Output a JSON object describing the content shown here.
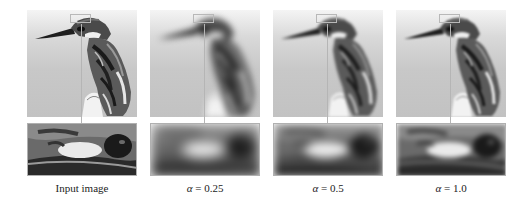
{
  "figure": {
    "layout": "4 columns, each with full image on top and zoomed eye-region inset below, connected by a leader line",
    "panels": [
      {
        "id": "input",
        "caption": "Input image",
        "sharpness": "sharp"
      },
      {
        "id": "alpha-0.25",
        "caption_symbol": "α",
        "caption_eq": " = ",
        "caption_value": "0.25",
        "sharpness": "very blurry"
      },
      {
        "id": "alpha-0.5",
        "caption_symbol": "α",
        "caption_eq": " = ",
        "caption_value": "0.5",
        "sharpness": "blurry"
      },
      {
        "id": "alpha-1.0",
        "caption_symbol": "α",
        "caption_eq": " = ",
        "caption_value": "1.0",
        "sharpness": "mostly sharp"
      }
    ],
    "colors": {
      "background": "#ffffff",
      "roi_box": "#b8b8b8",
      "leader_line": "#b5b5b5",
      "inset_border": "#b0b0b0"
    }
  }
}
